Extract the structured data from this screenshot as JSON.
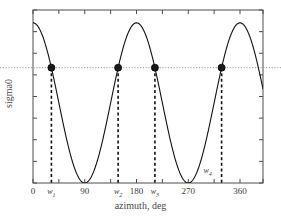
{
  "chart_data": {
    "type": "line",
    "title": "",
    "xlabel": "azimuth, deg",
    "ylabel": "sigma0",
    "xlim": [
      0,
      400
    ],
    "ylim": [
      0,
      1.08
    ],
    "grid": false,
    "legend": null,
    "x_ticks": [
      {
        "value": 0,
        "label": "0"
      },
      {
        "value": 45,
        "label": ""
      },
      {
        "value": 90,
        "label": "90"
      },
      {
        "value": 135,
        "label": ""
      },
      {
        "value": 180,
        "label": "180"
      },
      {
        "value": 225,
        "label": ""
      },
      {
        "value": 270,
        "label": "270"
      },
      {
        "value": 315,
        "label": ""
      },
      {
        "value": 360,
        "label": "360"
      },
      {
        "value": 400,
        "label": ""
      }
    ],
    "y_ticks_count": 9,
    "y_tick_labels": [],
    "series": [
      {
        "name": "sigma0",
        "type": "line",
        "color": "#111111",
        "description": "cos-squared azimuth modulation, maxima at 0, 180, 360 deg; minima at 90 and 270 deg",
        "formula": "sigma0 = cos(azimuth)^2, clipped at top of axes",
        "x": [
          0,
          10,
          20,
          30,
          40,
          50,
          60,
          70,
          80,
          90,
          100,
          110,
          120,
          130,
          140,
          150,
          160,
          170,
          180,
          190,
          200,
          210,
          220,
          230,
          240,
          250,
          260,
          270,
          280,
          290,
          300,
          310,
          320,
          330,
          340,
          350,
          360,
          370,
          380,
          390,
          400
        ],
        "y": [
          1.0,
          0.97,
          0.88,
          0.75,
          0.59,
          0.41,
          0.25,
          0.12,
          0.03,
          0.0,
          0.03,
          0.12,
          0.25,
          0.41,
          0.59,
          0.75,
          0.88,
          0.97,
          1.0,
          0.97,
          0.88,
          0.75,
          0.59,
          0.41,
          0.25,
          0.12,
          0.03,
          0.0,
          0.03,
          0.12,
          0.25,
          0.41,
          0.59,
          0.75,
          0.88,
          0.97,
          1.0,
          0.97,
          0.88,
          0.75,
          0.59
        ]
      }
    ],
    "threshold_line": {
      "name": "threshold",
      "style": "dotted",
      "color": "#9a9a9a",
      "y": 0.72,
      "orientation": "horizontal"
    },
    "markers": [
      {
        "label": "w1",
        "label_text": "w",
        "subscript": "1",
        "x": 32,
        "y": 0.72,
        "label_position": "below-axis"
      },
      {
        "label": "w2",
        "label_text": "w",
        "subscript": "2",
        "x": 148,
        "y": 0.72,
        "label_position": "below-axis"
      },
      {
        "label": "w3",
        "label_text": "w",
        "subscript": "3",
        "x": 212,
        "y": 0.72,
        "label_position": "below-axis"
      },
      {
        "label": "w4",
        "label_text": "w",
        "subscript": "4",
        "x": 328,
        "y": 0.72,
        "label_position": "inside-plot"
      }
    ],
    "marker_style": {
      "shape": "circle",
      "fill": "#1a1a1a",
      "size": 7
    },
    "dropline_style": {
      "style": "dashed",
      "color": "#111111",
      "width": 1.6
    }
  }
}
